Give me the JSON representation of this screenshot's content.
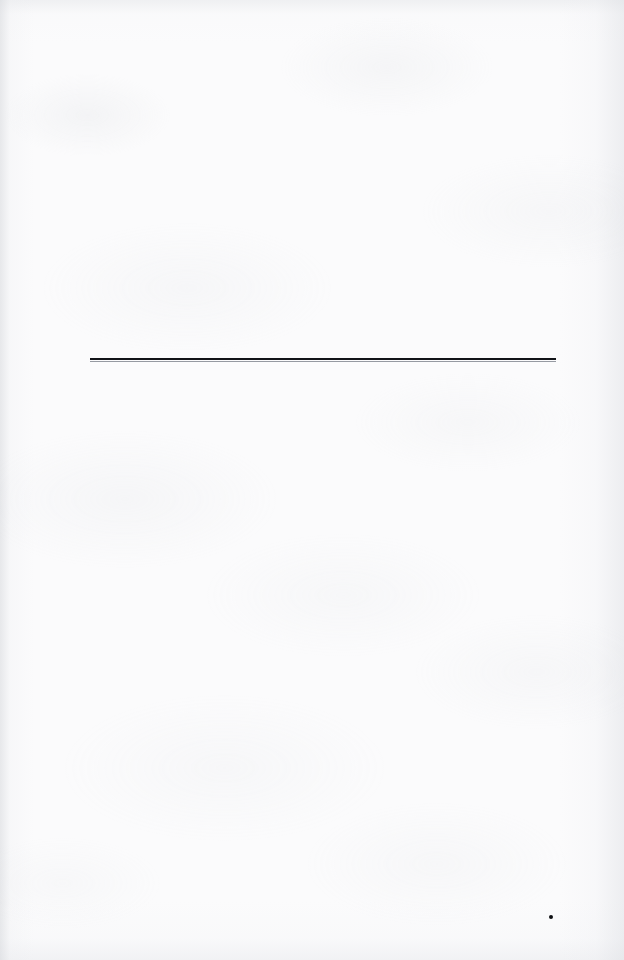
{
  "document": {
    "kind": "scanned-blank-page",
    "page_width": 624,
    "page_height": 960,
    "background_color": "#fbfbfc",
    "text_content": "",
    "visible_text_count": 0
  },
  "marks": {
    "horizontal_rule": {
      "name": "horizontal-rule",
      "color": "#111317",
      "left": 90,
      "top": 358,
      "width": 466,
      "height": 2,
      "shadow_color": "#969aa2",
      "shadow_top": 361,
      "shadow_height": 1
    },
    "ink_dot": {
      "name": "ink-dot",
      "color": "#0d0f12",
      "left": 549,
      "top": 915,
      "size": 4
    }
  }
}
